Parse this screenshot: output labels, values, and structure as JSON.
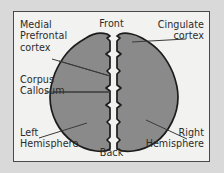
{
  "figure": {
    "view": "top-down axial view of the cerebrum",
    "colors": {
      "page_background": "#d9d9d9",
      "panel_background": "#f2f2f0",
      "frame_border": "#4a4a4a",
      "brain_fill": "#8a8a8a",
      "brain_outline": "#1c1c1c",
      "leader_line": "#3a3a3a",
      "text": "#2b2b2b"
    },
    "labels": {
      "medial_prefrontal_cortex": {
        "line1": "Medial",
        "line2": "Prefrontal",
        "line3": "cortex"
      },
      "cingulate_cortex": {
        "line1": "Cingulate",
        "line2": "cortex"
      },
      "corpus_callosum": {
        "line1": "Corpus",
        "line2": "Callosum"
      },
      "left_hemisphere": {
        "line1": "Left",
        "line2": "Hemisphere"
      },
      "right_hemisphere": {
        "line1": "Right",
        "line2": "Hemisphere"
      },
      "front": "Front",
      "back": "Back"
    }
  }
}
